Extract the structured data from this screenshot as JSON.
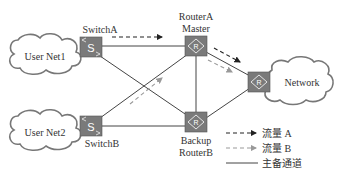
{
  "nodes": {
    "user_net1": {
      "label": "User Net1"
    },
    "user_net2": {
      "label": "User Net2"
    },
    "switch_a": {
      "label": "SwitchA",
      "glyph": "S"
    },
    "switch_b": {
      "label": "SwitchB",
      "glyph": "S"
    },
    "router_a": {
      "label_line1": "RouterA",
      "label_line2": "Master",
      "glyph": "R"
    },
    "router_b": {
      "label_line1": "Backup",
      "label_line2": "RouterB",
      "glyph": "R"
    },
    "network_router": {
      "glyph": "R"
    },
    "network": {
      "label": "Network"
    }
  },
  "legend": {
    "flow_a": "流量 A",
    "flow_b": "流量 B",
    "main_backup": "主备通道"
  },
  "colors": {
    "device_fill": "#7a7a7a",
    "line": "#444444",
    "flow_a": "#222222",
    "flow_b": "#9a9a9a",
    "cloud_stroke": "#777777"
  }
}
